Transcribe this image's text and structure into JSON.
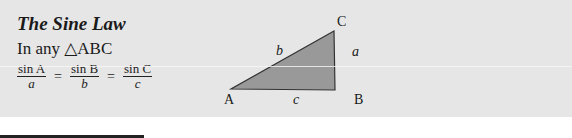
{
  "box": {
    "title": "The Sine Law",
    "subtitle": "In any △ABC",
    "formula": {
      "terms": [
        {
          "numerator": "sin A",
          "denominator": "a"
        },
        {
          "numerator": "sin B",
          "denominator": "b"
        },
        {
          "numerator": "sin C",
          "denominator": "c"
        }
      ],
      "equals": "="
    }
  },
  "triangle": {
    "vertices": {
      "A": "A",
      "B": "B",
      "C": "C"
    },
    "sides": {
      "a": "a",
      "b": "b",
      "c": "c"
    },
    "fill_color": "#999999",
    "stroke_color": "#333333"
  },
  "colors": {
    "panel_background": "#e6e6e6",
    "page_background": "#ffffff"
  }
}
